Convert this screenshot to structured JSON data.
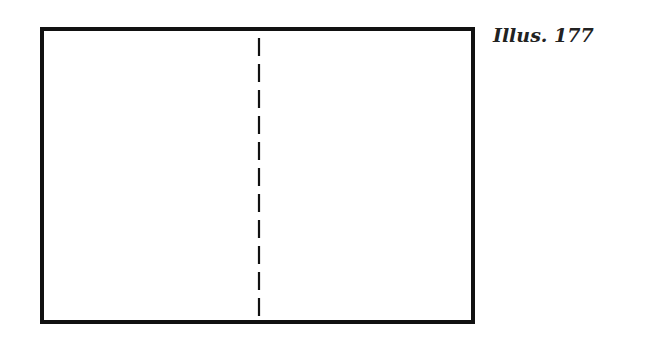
{
  "caption": "Illus. 177",
  "diagram": {
    "shape": "rectangle",
    "fold_line": "vertical dashed",
    "colors": {
      "stroke": "#111111",
      "background": "#ffffff"
    }
  }
}
